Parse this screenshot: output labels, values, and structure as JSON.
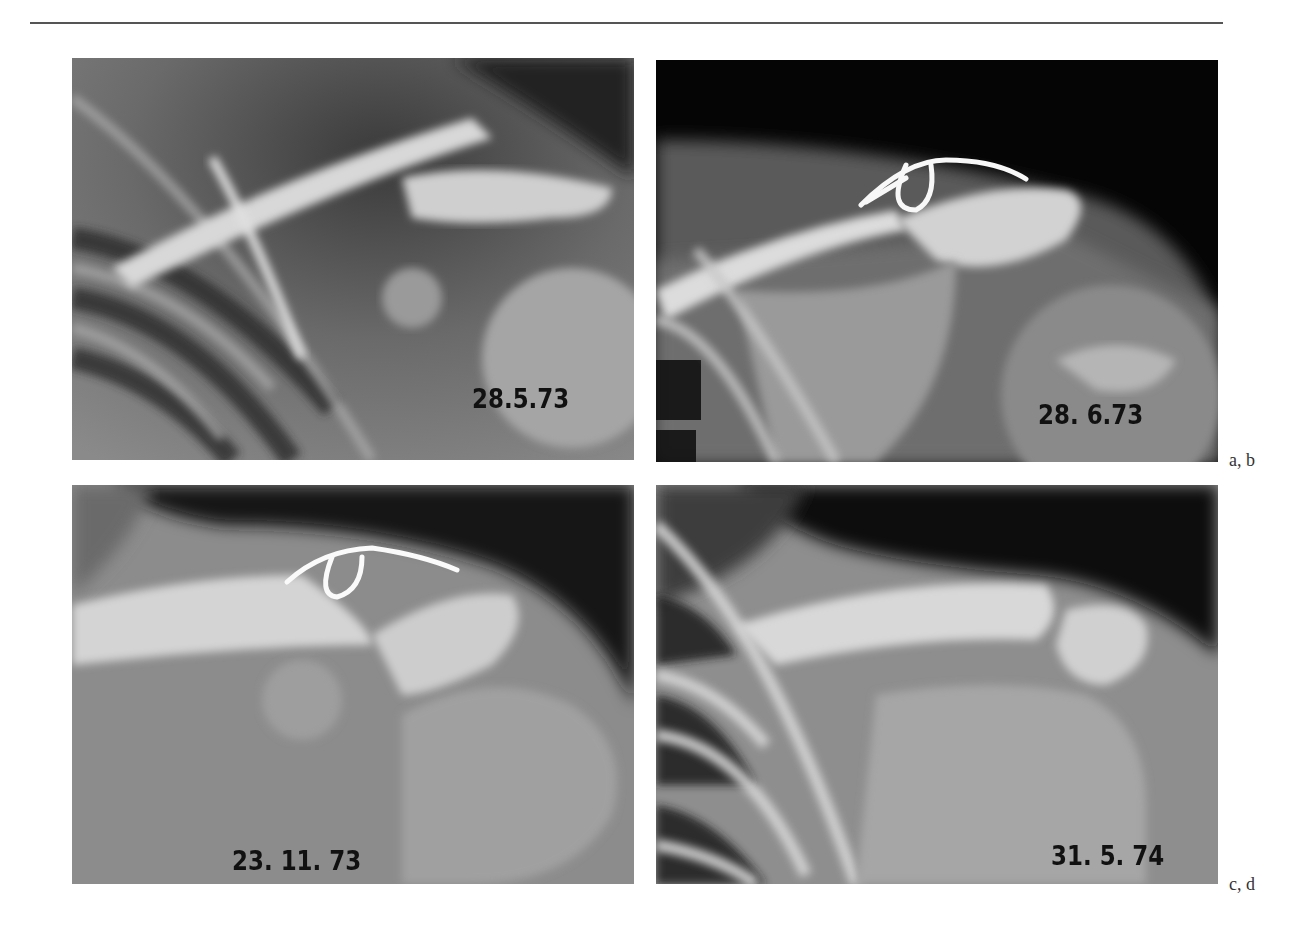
{
  "page": {
    "type": "book page with radiograph figure"
  },
  "figure": {
    "panels": [
      {
        "id": "a",
        "date_label": "28.5.73",
        "description": "Shoulder X-ray, acromioclavicular dislocation before surgery"
      },
      {
        "id": "b",
        "date_label": "28. 6.73",
        "description": "Shoulder X-ray with wire cerclage fixation"
      },
      {
        "id": "c",
        "date_label": "23. 11. 73",
        "description": "Shoulder X-ray follow-up with wire fixation"
      },
      {
        "id": "d",
        "date_label": "31. 5. 74",
        "description": "Shoulder X-ray after removal of fixation"
      }
    ],
    "row_labels": [
      "a, b",
      "c, d"
    ]
  }
}
